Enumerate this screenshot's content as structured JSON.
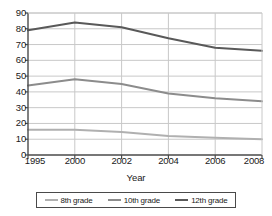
{
  "chart_data": {
    "type": "line",
    "title": "",
    "xlabel": "Year",
    "ylabel": "",
    "categories": [
      "1995",
      "2000",
      "2002",
      "2004",
      "2006",
      "2008"
    ],
    "ylim": [
      0,
      90
    ],
    "ytick_labels": [
      "0",
      "10",
      "20",
      "30",
      "40",
      "50",
      "60",
      "70",
      "80",
      "90"
    ],
    "ytick_values": [
      0,
      10,
      20,
      30,
      40,
      50,
      60,
      70,
      80,
      90
    ],
    "grid": true,
    "grid_axis": "y",
    "legend_position": "bottom",
    "series": [
      {
        "name": "8th grade",
        "color": "#b0b0b0",
        "values": [
          16,
          16,
          14.5,
          12,
          11,
          10
        ]
      },
      {
        "name": "10th grade",
        "color": "#8c8c8c",
        "values": [
          44,
          48,
          45,
          39,
          36,
          34
        ]
      },
      {
        "name": "12th grade",
        "color": "#595959",
        "values": [
          79,
          84,
          81,
          74,
          68,
          66
        ]
      }
    ]
  },
  "axes": {
    "x_title": "Year",
    "x_tick_labels": [
      "1995",
      "2000",
      "2002",
      "2004",
      "2006",
      "2008"
    ],
    "y_tick_labels": [
      "90",
      "80",
      "70",
      "60",
      "50",
      "40",
      "30",
      "20",
      "10",
      "0"
    ]
  },
  "legend": {
    "items": [
      {
        "label": "8th grade",
        "color": "#b0b0b0"
      },
      {
        "label": "10th grade",
        "color": "#8c8c8c"
      },
      {
        "label": "12th grade",
        "color": "#595959"
      }
    ]
  },
  "style": {
    "axis_color": "#4a4a4a",
    "grid_color": "#c8c8c8",
    "text_color": "#1a1a1a",
    "background": "#ffffff"
  }
}
